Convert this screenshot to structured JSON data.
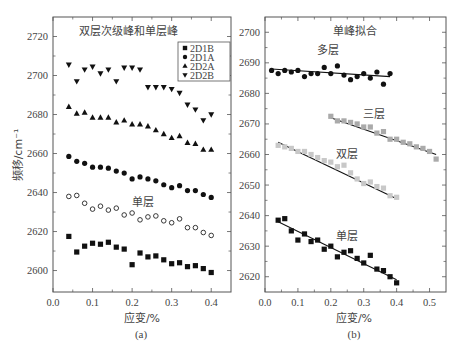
{
  "figure": {
    "ylabel": "频移/cm⁻¹",
    "panels": [
      "(a)",
      "(b)"
    ]
  },
  "chart_data": [
    {
      "type": "scatter",
      "panel": "(a)",
      "title": "双层次级峰和单层峰",
      "xlabel": "应变/%",
      "ylabel": "频移/cm⁻¹",
      "xlim": [
        0.0,
        0.45
      ],
      "ylim": [
        2589,
        2730
      ],
      "xticks": [
        0.0,
        0.1,
        0.2,
        0.3,
        0.4
      ],
      "xtick_labels": [
        "0.0",
        "0.1",
        "0.2",
        "0.3",
        "0.4"
      ],
      "yticks": [
        2600,
        2620,
        2640,
        2660,
        2680,
        2700,
        2720
      ],
      "ytick_labels": [
        "2600",
        "2620",
        "2640",
        "2660",
        "2680",
        "2700",
        "2720"
      ],
      "grid": false,
      "legend_position": "upper right",
      "annotations": [
        {
          "text": "单层",
          "x": 0.2,
          "y": 2634
        }
      ],
      "x": [
        0.04,
        0.06,
        0.08,
        0.1,
        0.12,
        0.14,
        0.16,
        0.18,
        0.2,
        0.22,
        0.24,
        0.26,
        0.28,
        0.3,
        0.32,
        0.34,
        0.36,
        0.38,
        0.4
      ],
      "series": [
        {
          "name": "2D1B",
          "marker": "square",
          "fill": "#111111",
          "values": [
            2617.5,
            2609.5,
            2612.5,
            2614,
            2613.5,
            2614.5,
            2612,
            2611,
            2603,
            2609,
            2607,
            2607.5,
            2605.5,
            2603.5,
            2604,
            2602,
            2602.5,
            2601,
            2599
          ]
        },
        {
          "name": "2D1A",
          "marker": "circle",
          "fill": "#111111",
          "values": [
            2658.5,
            2656,
            2655,
            2653,
            2653,
            2652.5,
            2651,
            2650,
            2647,
            2648,
            2647,
            2646,
            2644,
            2642.5,
            2643.5,
            2641,
            2641,
            2639,
            2637.5
          ]
        },
        {
          "name": "2D2A",
          "marker": "triangle-up",
          "fill": "#111111",
          "values": [
            2684,
            2680.5,
            2681,
            2678.5,
            2678.5,
            2678.5,
            2676,
            2677,
            2675,
            2675,
            2674,
            2672,
            2670,
            2668,
            2669,
            2665.5,
            2665,
            2662,
            2662
          ]
        },
        {
          "name": "2D2B",
          "marker": "triangle-down",
          "fill": "#111111",
          "values": [
            2705.5,
            2697,
            2703,
            2704.5,
            2701,
            2703,
            2697,
            2704,
            2704,
            2703,
            2694,
            2694,
            2694,
            2693,
            2691,
            2685,
            2682.5,
            2677,
            2680
          ]
        },
        {
          "name": "单层",
          "marker": "circle-open",
          "fill": "none",
          "legend": false,
          "values": [
            2638,
            2638.5,
            2634.5,
            2631.5,
            2633,
            2631,
            2632,
            2628.5,
            2629.5,
            2626,
            2627.5,
            2628,
            2625.5,
            2624.5,
            2626.5,
            2622,
            2622,
            2619.5,
            2618
          ]
        }
      ]
    },
    {
      "type": "scatter",
      "panel": "(b)",
      "title": "单峰拟合",
      "xlabel": "应变/%",
      "ylabel": "",
      "xlim": [
        0.0,
        0.55
      ],
      "ylim": [
        2615,
        2705
      ],
      "xticks": [
        0.0,
        0.1,
        0.2,
        0.3,
        0.4,
        0.5
      ],
      "xtick_labels": [
        "0.0",
        "0.1",
        "0.2",
        "0.3",
        "0.4",
        "0.5"
      ],
      "yticks": [
        2620,
        2630,
        2640,
        2650,
        2660,
        2670,
        2680,
        2690,
        2700
      ],
      "ytick_labels": [
        "2620",
        "2630",
        "2640",
        "2650",
        "2660",
        "2670",
        "2680",
        "2690",
        "2700"
      ],
      "grid": false,
      "legend_position": "none",
      "series": [
        {
          "name": "多层",
          "marker": "circle",
          "fill": "#111111",
          "label_pos": [
            0.19,
            2693
          ],
          "x": [
            0.02,
            0.04,
            0.06,
            0.08,
            0.1,
            0.12,
            0.14,
            0.16,
            0.18,
            0.2,
            0.22,
            0.24,
            0.26,
            0.28,
            0.3,
            0.32,
            0.34,
            0.36,
            0.38
          ],
          "values": [
            2687.5,
            2686.5,
            2687.5,
            2687,
            2687.5,
            2685.5,
            2686.5,
            2686.5,
            2688.5,
            2686.5,
            2689,
            2686,
            2684.5,
            2685.5,
            2686.5,
            2685,
            2687,
            2683,
            2686.5
          ],
          "fit": {
            "x": [
              0.02,
              0.38
            ],
            "y": [
              2688,
              2685.5
            ]
          }
        },
        {
          "name": "三层",
          "marker": "square",
          "fill": "#aaaaaa",
          "label_pos": [
            0.33,
            2672
          ],
          "x": [
            0.2,
            0.22,
            0.24,
            0.26,
            0.28,
            0.3,
            0.32,
            0.34,
            0.36,
            0.38,
            0.4,
            0.42,
            0.44,
            0.46,
            0.48,
            0.5,
            0.52
          ],
          "values": [
            2672.5,
            2671,
            2671,
            2670.5,
            2670,
            2669,
            2669,
            2667,
            2667.5,
            2665,
            2665,
            2664,
            2663.5,
            2662.5,
            2662,
            2661,
            2658.5
          ],
          "fit": {
            "x": [
              0.2,
              0.52
            ],
            "y": [
              2672,
              2660
            ]
          }
        },
        {
          "name": "双层",
          "marker": "square",
          "fill": "#c8c8c8",
          "label_pos": [
            0.25,
            2659
          ],
          "x": [
            0.04,
            0.06,
            0.08,
            0.1,
            0.12,
            0.14,
            0.16,
            0.18,
            0.2,
            0.22,
            0.24,
            0.26,
            0.28,
            0.3,
            0.32,
            0.34,
            0.36,
            0.38,
            0.4
          ],
          "values": [
            2663,
            2662.5,
            2662,
            2661,
            2661,
            2660,
            2659,
            2658,
            2657.5,
            2656,
            2656.5,
            2654,
            2652,
            2650.5,
            2651,
            2649.5,
            2649,
            2646.5,
            2646
          ],
          "fit": {
            "x": [
              0.04,
              0.4
            ],
            "y": [
              2664,
              2645.5
            ]
          }
        },
        {
          "name": "单层",
          "marker": "square",
          "fill": "#111111",
          "label_pos": [
            0.25,
            2632
          ],
          "x": [
            0.04,
            0.06,
            0.08,
            0.1,
            0.12,
            0.14,
            0.16,
            0.18,
            0.2,
            0.22,
            0.24,
            0.26,
            0.28,
            0.3,
            0.32,
            0.34,
            0.36,
            0.38,
            0.4
          ],
          "values": [
            2638.5,
            2639,
            2635,
            2632,
            2634,
            2631.5,
            2632,
            2629,
            2630,
            2626.5,
            2628,
            2628.5,
            2626,
            2624.5,
            2627,
            2622.5,
            2622,
            2620,
            2618
          ],
          "fit": {
            "x": [
              0.04,
              0.4
            ],
            "y": [
              2638,
              2619
            ]
          }
        }
      ]
    }
  ]
}
